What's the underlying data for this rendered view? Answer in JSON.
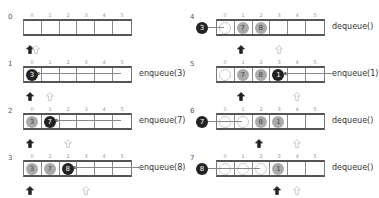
{
  "indices": [
    "0",
    "1",
    "2",
    "3",
    "4",
    "5"
  ],
  "panels": [
    {
      "step": "0",
      "op": "",
      "cells": [
        "",
        "",
        "",
        "",
        "",
        ""
      ],
      "front": 0,
      "rear": 0
    },
    {
      "step": "1",
      "op": "enqueue(3)",
      "cells": [
        "3",
        "",
        "",
        "",
        "",
        ""
      ],
      "front": 0,
      "rear": 1
    },
    {
      "step": "2",
      "op": "enqueue(7)",
      "cells": [
        "3",
        "7",
        "",
        "",
        "",
        ""
      ],
      "front": 0,
      "rear": 2
    },
    {
      "step": "3",
      "op": "enqueue(8)",
      "cells": [
        "3",
        "7",
        "8",
        "",
        "",
        ""
      ],
      "front": 0,
      "rear": 3
    },
    {
      "step": "4",
      "op": "dequeue()",
      "removed": "3",
      "cells": [
        "",
        "7",
        "8",
        "",
        "",
        ""
      ],
      "front": 1,
      "rear": 3
    },
    {
      "step": "5",
      "op": "enqueue(1)",
      "cells": [
        "",
        "7",
        "8",
        "1",
        "",
        ""
      ],
      "front": 1,
      "rear": 4
    },
    {
      "step": "6",
      "op": "dequeue()",
      "removed": "7",
      "cells": [
        "",
        "",
        "8",
        "1",
        "",
        ""
      ],
      "front": 2,
      "rear": 4
    },
    {
      "step": "7",
      "op": "dequeue()",
      "removed": "8",
      "cells": [
        "",
        "",
        "",
        "1",
        "",
        ""
      ],
      "front": 3,
      "rear": 4
    }
  ],
  "colors": {
    "new_item": "#222222",
    "old_item": "#aaaaaa",
    "empty_slot": "#cccccc",
    "border": "#555555"
  }
}
